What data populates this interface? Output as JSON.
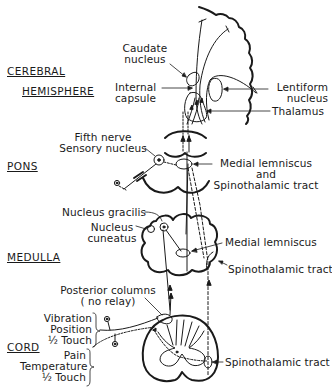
{
  "regions": {
    "cerebral": [
      "CEREBRAL",
      "HEMISPHERE"
    ],
    "pons": "PONS",
    "medulla": "MEDULLA",
    "cord": "CORD"
  },
  "labels": {
    "caudate": [
      "Caudate",
      "nucleus"
    ],
    "internal_capsule": [
      "Internal",
      "capsule"
    ],
    "lentiform": [
      "Lentiform",
      "nucleus"
    ],
    "thalamus": "Thalamus",
    "fifth_nerve": [
      "Fifth nerve",
      "Sensory nucleus"
    ],
    "pons_tracts": [
      "Medial lemniscus",
      "and",
      "Spinothalamic tract"
    ],
    "nucleus_gracilis": "Nucleus gracilis",
    "nucleus_cuneatus": [
      "Nucleus",
      "cuneatus"
    ],
    "medulla_medial_lemniscus": "Medial lemniscus",
    "medulla_spinothalamic": "Spinothalamic tract",
    "posterior_columns": [
      "Posterior columns",
      "( no relay)"
    ],
    "dorsal_modalities": [
      "Vibration",
      "Position",
      "½ Touch"
    ],
    "ventral_modalities": [
      "Pain",
      "Temperature",
      "½ Touch"
    ],
    "cord_spinothalamic": "Spinothalamic tract"
  },
  "colors": {
    "ink": "#1a1a1a",
    "background": "#ffffff"
  }
}
